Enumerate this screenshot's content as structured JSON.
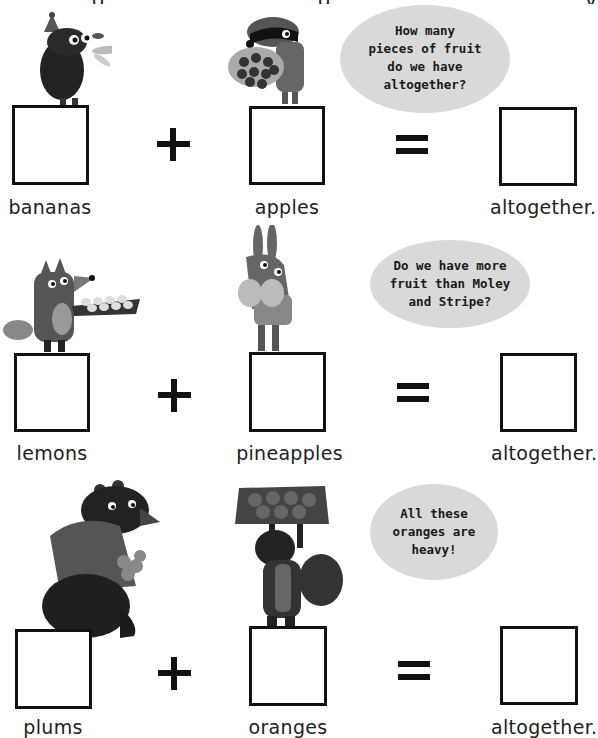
{
  "page": {
    "background": "#ffffff",
    "top_cut_text": [
      "g",
      "g",
      "y"
    ]
  },
  "colors": {
    "box_border": "#111111",
    "bubble_fill": "#d9d9d9",
    "text": "#222222"
  },
  "rows": [
    {
      "left_label": "bananas",
      "right_label": "apples",
      "result_label": "altogether.",
      "operator_add": "+",
      "operator_equals": "=",
      "left_character": "mole-with-bananas",
      "right_character": "badger-with-apples",
      "speech_bubble": [
        "How many",
        "pieces of fruit",
        "do we have",
        "altogether?"
      ]
    },
    {
      "left_label": "lemons",
      "right_label": "pineapples",
      "result_label": "altogether.",
      "operator_add": "+",
      "operator_equals": "=",
      "left_character": "fox-with-lemon-tray",
      "right_character": "rabbit-with-pineapples",
      "speech_bubble": [
        "Do we have more",
        "fruit than Moley",
        "and Stripe?"
      ]
    },
    {
      "left_label": "plums",
      "right_label": "oranges",
      "result_label": "altogether.",
      "operator_add": "+",
      "operator_equals": "=",
      "left_character": "bear-with-plums",
      "right_character": "squirrel-with-orange-crate",
      "speech_bubble": [
        "All these",
        "oranges are",
        "heavy!"
      ]
    }
  ]
}
